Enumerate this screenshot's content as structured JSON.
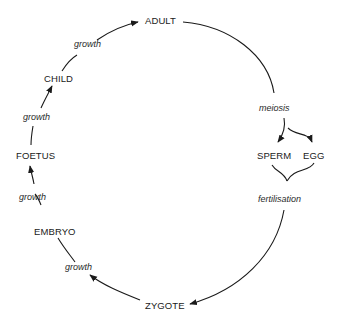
{
  "stages": {
    "adult": "ADULT",
    "child": "CHILD",
    "foetus": "FOETUS",
    "embryo": "EMBRYO",
    "zygote": "ZYGOTE",
    "sperm": "SPERM",
    "egg": "EGG"
  },
  "processes": {
    "growth_child_adult": "growth",
    "growth_foetus_child": "growth",
    "growth_embryo_foetus": "growth",
    "growth_zygote_embryo": "growth",
    "meiosis": "meiosis",
    "fertilisation": "fertilisation"
  },
  "colors": {
    "line": "#1a1a1a",
    "background": "#ffffff"
  }
}
